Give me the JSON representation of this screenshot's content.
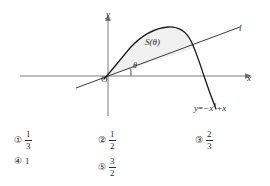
{
  "figure": {
    "axes": {
      "y_label": "y",
      "x_label": "x",
      "origin_label": "O"
    },
    "line_label": "l",
    "angle_label": "θ",
    "region_label": "S(θ)",
    "equation": {
      "lhs": "y",
      "equals": "=",
      "term1_base": "−x",
      "term1_exponent": "3",
      "term2": "+x",
      "full": "y=−x³+x"
    },
    "colors": {
      "curve": "#1a1a1a",
      "line": "#3a3a3a",
      "axis": "#6e6e6e",
      "shade": "#f0f0f0",
      "text": "#2b2b2b"
    }
  },
  "choices": [
    {
      "marker": "①",
      "type": "fraction",
      "numerator": "1",
      "denominator": "3",
      "value": "1/3"
    },
    {
      "marker": "②",
      "type": "fraction",
      "numerator": "1",
      "denominator": "2",
      "value": "1/2"
    },
    {
      "marker": "③",
      "type": "fraction",
      "numerator": "2",
      "denominator": "3",
      "value": "2/3"
    },
    {
      "marker": "④",
      "type": "whole",
      "whole": "1",
      "value": "1"
    },
    {
      "marker": "⑤",
      "type": "fraction",
      "numerator": "3",
      "denominator": "2",
      "value": "3/2"
    }
  ]
}
